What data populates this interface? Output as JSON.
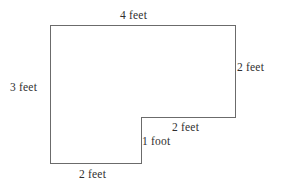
{
  "figure": {
    "kind": "l-shaped-polygon",
    "stroke_color": "#6b6b6b",
    "fill_color": "#ffffff",
    "stroke_width": 1,
    "background_color": "#ffffff",
    "text_color": "#2f2f2f",
    "vertices": [
      {
        "name": "top-left",
        "x": 50,
        "y": 25
      },
      {
        "name": "top-right",
        "x": 235,
        "y": 25
      },
      {
        "name": "right-bottom",
        "x": 235,
        "y": 117
      },
      {
        "name": "notch-inner",
        "x": 141,
        "y": 117
      },
      {
        "name": "notch-bottom",
        "x": 141,
        "y": 163
      },
      {
        "name": "bottom-left",
        "x": 50,
        "y": 163
      }
    ],
    "points_attr": "50,25 235,25 235,117 141,117 141,163 50,163"
  },
  "labels": {
    "top": "4 feet",
    "left": "3 feet",
    "right": "2 feet",
    "notch_horizontal": "2 feet",
    "notch_vertical": "1 foot",
    "bottom": "2 feet"
  },
  "chart_data": {
    "type": "diagram",
    "title": "",
    "shape": "L-shaped polygon",
    "side_labels": [
      {
        "side": "top",
        "value": 4,
        "unit": "feet",
        "text": "4 feet"
      },
      {
        "side": "right",
        "value": 2,
        "unit": "feet",
        "text": "2 feet"
      },
      {
        "side": "inner-horizontal",
        "value": 2,
        "unit": "feet",
        "text": "2 feet"
      },
      {
        "side": "inner-vertical",
        "value": 1,
        "unit": "foot",
        "text": "1 foot"
      },
      {
        "side": "bottom",
        "value": 2,
        "unit": "feet",
        "text": "2 feet"
      },
      {
        "side": "left",
        "value": 3,
        "unit": "feet",
        "text": "3 feet"
      }
    ]
  }
}
